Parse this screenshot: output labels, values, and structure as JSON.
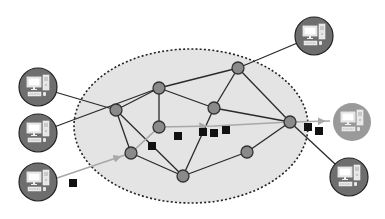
{
  "diagram": {
    "type": "network",
    "colors": {
      "background": "#ffffff",
      "cloud_fill": "#e4e4e4",
      "cloud_border": "#222222",
      "node_fill": "#8a8a8a",
      "node_stroke": "#333333",
      "edge": "#2a2a2a",
      "flow_arrow": "#a8a8a8",
      "packet": "#111111",
      "pc_disc": "#6e6e6e",
      "pc_disc_highlight": "#9a9a9a",
      "pc_screen": "#ffffff"
    },
    "cloud": {
      "cx": 191,
      "cy": 126,
      "rx": 117,
      "ry": 77
    },
    "routers": [
      {
        "id": "A",
        "x": 116,
        "y": 110
      },
      {
        "id": "B",
        "x": 159,
        "y": 88
      },
      {
        "id": "C",
        "x": 238,
        "y": 68
      },
      {
        "id": "D",
        "x": 214,
        "y": 108
      },
      {
        "id": "E",
        "x": 290,
        "y": 122
      },
      {
        "id": "F",
        "x": 159,
        "y": 127
      },
      {
        "id": "G",
        "x": 131,
        "y": 153
      },
      {
        "id": "H",
        "x": 183,
        "y": 176
      },
      {
        "id": "I",
        "x": 247,
        "y": 152
      }
    ],
    "edges": [
      [
        "A",
        "B"
      ],
      [
        "B",
        "C"
      ],
      [
        "B",
        "D"
      ],
      [
        "B",
        "F"
      ],
      [
        "C",
        "D"
      ],
      [
        "C",
        "E"
      ],
      [
        "D",
        "E"
      ],
      [
        "D",
        "H"
      ],
      [
        "A",
        "G"
      ],
      [
        "A",
        "H"
      ],
      [
        "G",
        "H"
      ],
      [
        "H",
        "I"
      ],
      [
        "I",
        "E"
      ]
    ],
    "computers": [
      {
        "id": "pc-left-top",
        "x": 38,
        "y": 87,
        "link": "A",
        "highlight": false
      },
      {
        "id": "pc-left-mid",
        "x": 38,
        "y": 133,
        "link": "B",
        "highlight": false
      },
      {
        "id": "pc-left-bottom",
        "x": 38,
        "y": 182,
        "link": "G",
        "flow": true,
        "highlight": false
      },
      {
        "id": "pc-top-right",
        "x": 314,
        "y": 36,
        "link": "C",
        "highlight": false
      },
      {
        "id": "pc-right-destination",
        "x": 352,
        "y": 122,
        "link": "E",
        "flow": true,
        "highlight": true
      },
      {
        "id": "pc-bottom-right",
        "x": 349,
        "y": 177,
        "link": "E",
        "highlight": false
      }
    ],
    "flow_path": [
      [
        57,
        178
      ],
      [
        131,
        153
      ],
      [
        159,
        127
      ],
      [
        214,
        126
      ],
      [
        290,
        122
      ],
      [
        330,
        121
      ]
    ],
    "packets": [
      {
        "x": 73,
        "y": 183
      },
      {
        "x": 152,
        "y": 146
      },
      {
        "x": 178,
        "y": 136
      },
      {
        "x": 203,
        "y": 132
      },
      {
        "x": 214,
        "y": 133
      },
      {
        "x": 226,
        "y": 130
      },
      {
        "x": 308,
        "y": 127
      },
      {
        "x": 319,
        "y": 131
      }
    ]
  }
}
